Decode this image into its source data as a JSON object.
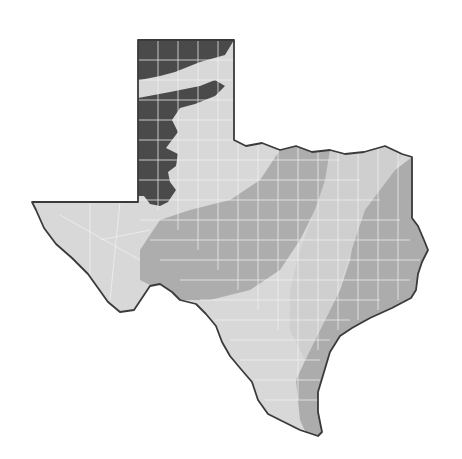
{
  "map": {
    "subject": "Texas",
    "style": "grayscale choropleth with county boundaries",
    "colors": {
      "background": "#ffffff",
      "outline": "#3a3a3a",
      "county_lines": "#f2f2f2",
      "zone_dark": "#4a4a4a",
      "zone_light": "#d6d6d6",
      "zone_medium": "#ababab",
      "zone_medium_light": "#c4c4c4"
    },
    "zones": [
      {
        "id": "panhandle-dark",
        "shade": "dark"
      },
      {
        "id": "west-south-light",
        "shade": "light"
      },
      {
        "id": "central-medium",
        "shade": "medium"
      },
      {
        "id": "central-corridor-light",
        "shade": "light"
      },
      {
        "id": "east-gulf-medium",
        "shade": "medium"
      }
    ]
  }
}
